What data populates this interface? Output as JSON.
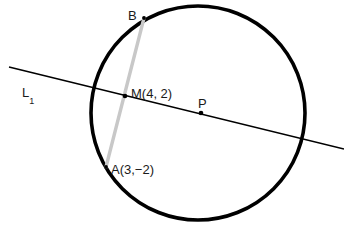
{
  "figure": {
    "background_color": "#ffffff"
  },
  "labels": {
    "line_label": "L",
    "line_label_subscript": "1",
    "point_b": "B",
    "point_m": "M(4, 2)",
    "point_p": "P",
    "point_a": "A(3,−2)"
  },
  "geometry": {
    "circle": {
      "name": "circle",
      "center_x": 198,
      "center_y": 113,
      "radius": 107,
      "stroke_color": "#000000",
      "stroke_width": 3.6,
      "fill": "none"
    },
    "chord_ab": {
      "name": "chord-ab",
      "x1": 144,
      "y1": 18,
      "x2": 106,
      "y2": 167,
      "stroke_color": "#c8c8c8",
      "stroke_width": 3.4
    },
    "line_l1": {
      "name": "secant-line-l1",
      "x1": 9,
      "y1": 67,
      "x2": 344,
      "y2": 149,
      "stroke_color": "#000000",
      "stroke_width": 1.6
    },
    "points": [
      {
        "name": "point-b",
        "label": "B",
        "x": 144,
        "y": 18,
        "radius": 1.9,
        "color": "#000000"
      },
      {
        "name": "point-m",
        "label": "M(4, 2)",
        "x": 125,
        "y": 96,
        "radius": 2.3,
        "color": "#000000"
      },
      {
        "name": "point-p",
        "label": "P",
        "x": 201,
        "y": 113,
        "radius": 2.3,
        "color": "#000000"
      },
      {
        "name": "point-a",
        "label": "A(3,−2)",
        "x": 106,
        "y": 167,
        "radius": 1.9,
        "color": "#000000"
      }
    ]
  },
  "chart_data": {
    "type": "scatter",
    "title": "",
    "xlabel": "",
    "ylabel": "",
    "annotations": [
      "L1",
      "B",
      "M(4, 2)",
      "P",
      "A(3,−2)"
    ],
    "points": [
      {
        "label": "M",
        "x": 4,
        "y": 2
      },
      {
        "label": "A",
        "x": 3,
        "y": -2
      }
    ]
  }
}
